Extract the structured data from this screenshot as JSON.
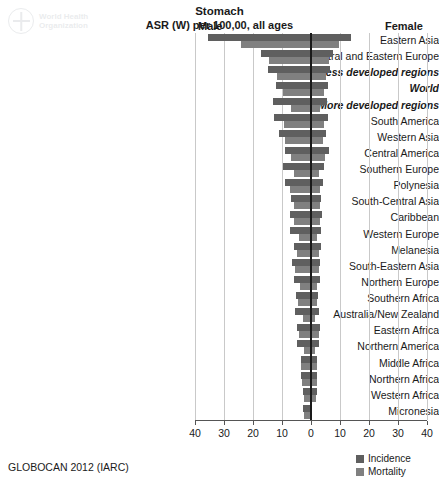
{
  "logo": {
    "line1": "World Health",
    "line2": "Organization",
    "name": "who-logo"
  },
  "header": {
    "title": "Stomach",
    "subtitle": "ASR (W) per 100,00, all ages",
    "male_label": "Male",
    "female_label": "Female"
  },
  "footer": {
    "source": "GLOBOCAN 2012 (IARC)"
  },
  "legend": {
    "items": [
      {
        "label": "Incidence",
        "color": "#5f5f5f"
      },
      {
        "label": "Mortality",
        "color": "#808080"
      }
    ]
  },
  "chart_data": {
    "type": "bar",
    "orientation": "horizontal",
    "layout": "population-pyramid",
    "title": "Stomach",
    "subtitle": "ASR (W) per 100,00, all ages",
    "xlabel": "ASR (W) per 100,00, all ages",
    "ylabel": "",
    "left_side": "Male",
    "right_side": "Female",
    "xlim": [
      -40,
      40
    ],
    "xticks": [
      -40,
      -30,
      -20,
      -10,
      0,
      10,
      20,
      30,
      40
    ],
    "xtick_labels": [
      "40",
      "30",
      "20",
      "10",
      "0",
      "10",
      "20",
      "30",
      "40"
    ],
    "grid": true,
    "legend_position": "bottom-right",
    "series_names": [
      "Incidence",
      "Mortality"
    ],
    "colors": {
      "incidence": "#5f5f5f",
      "mortality": "#808080",
      "zero_line": "#1a1a1a",
      "gridline": "#c9c9c9"
    },
    "categories": [
      "Eastern Asia",
      "Central and Eastern Europe",
      "Less developed regions",
      "World",
      "More developed regions",
      "South America",
      "Western Asia",
      "Central America",
      "Southern Europe",
      "Polynesia",
      "South-Central Asia",
      "Caribbean",
      "Western Europe",
      "Melanesia",
      "South-Eastern Asia",
      "Northern Europe",
      "Southern Africa",
      "Australia/New Zealand",
      "Eastern Africa",
      "Northern America",
      "Middle Africa",
      "Northern Africa",
      "Western Africa",
      "Micronesia"
    ],
    "emphasized_categories": [
      "Less developed regions",
      "World",
      "More developed regions"
    ],
    "rows": [
      {
        "category": "Eastern Asia",
        "male_incidence": 35.4,
        "male_mortality": 24.0,
        "female_incidence": 13.8,
        "female_mortality": 9.8
      },
      {
        "category": "Central and Eastern Europe",
        "male_incidence": 17.1,
        "male_mortality": 14.6,
        "female_incidence": 7.5,
        "female_mortality": 6.2
      },
      {
        "category": "Less developed regions",
        "male_incidence": 15.0,
        "male_mortality": 11.8,
        "female_incidence": 6.5,
        "female_mortality": 5.2
      },
      {
        "category": "World",
        "male_incidence": 12.1,
        "male_mortality": 9.7,
        "female_incidence": 5.7,
        "female_mortality": 4.5
      },
      {
        "category": "More developed regions",
        "male_incidence": 13.0,
        "male_mortality": 7.0,
        "female_incidence": 5.4,
        "female_mortality": 3.1
      },
      {
        "category": "South America",
        "male_incidence": 12.7,
        "male_mortality": 9.3,
        "female_incidence": 5.9,
        "female_mortality": 4.4
      },
      {
        "category": "Western Asia",
        "male_incidence": 11.0,
        "male_mortality": 9.0,
        "female_incidence": 5.0,
        "female_mortality": 4.2
      },
      {
        "category": "Central America",
        "male_incidence": 8.8,
        "male_mortality": 6.8,
        "female_incidence": 6.1,
        "female_mortality": 4.9
      },
      {
        "category": "Southern Europe",
        "male_incidence": 9.6,
        "male_mortality": 5.7,
        "female_incidence": 4.5,
        "female_mortality": 2.7
      },
      {
        "category": "Polynesia",
        "male_incidence": 9.0,
        "male_mortality": 7.1,
        "female_incidence": 4.1,
        "female_mortality": 3.2
      },
      {
        "category": "South-Central Asia",
        "male_incidence": 6.8,
        "male_mortality": 6.0,
        "female_incidence": 3.6,
        "female_mortality": 3.2
      },
      {
        "category": "Caribbean",
        "male_incidence": 7.4,
        "male_mortality": 5.8,
        "female_incidence": 3.9,
        "female_mortality": 3.1
      },
      {
        "category": "Western Europe",
        "male_incidence": 7.4,
        "male_mortality": 4.1,
        "female_incidence": 3.5,
        "female_mortality": 2.0
      },
      {
        "category": "Melanesia",
        "male_incidence": 6.0,
        "male_mortality": 5.0,
        "female_incidence": 3.4,
        "female_mortality": 2.8
      },
      {
        "category": "South-Eastern Asia",
        "male_incidence": 6.4,
        "male_mortality": 5.4,
        "female_incidence": 3.2,
        "female_mortality": 2.7
      },
      {
        "category": "Northern Europe",
        "male_incidence": 6.0,
        "male_mortality": 3.7,
        "female_incidence": 3.0,
        "female_mortality": 1.9
      },
      {
        "category": "Southern Africa",
        "male_incidence": 5.2,
        "male_mortality": 4.4,
        "female_incidence": 2.4,
        "female_mortality": 2.0
      },
      {
        "category": "Australia/New Zealand",
        "male_incidence": 5.4,
        "male_mortality": 2.7,
        "female_incidence": 2.6,
        "female_mortality": 1.4
      },
      {
        "category": "Eastern Africa",
        "male_incidence": 4.7,
        "male_mortality": 4.2,
        "female_incidence": 3.1,
        "female_mortality": 2.8
      },
      {
        "category": "Northern America",
        "male_incidence": 5.0,
        "male_mortality": 2.3,
        "female_incidence": 2.6,
        "female_mortality": 1.3
      },
      {
        "category": "Middle Africa",
        "male_incidence": 3.6,
        "male_mortality": 3.3,
        "female_incidence": 2.2,
        "female_mortality": 2.0
      },
      {
        "category": "Northern Africa",
        "male_incidence": 3.5,
        "male_mortality": 3.1,
        "female_incidence": 2.1,
        "female_mortality": 1.9
      },
      {
        "category": "Western Africa",
        "male_incidence": 2.6,
        "male_mortality": 2.4,
        "female_incidence": 2.0,
        "female_mortality": 1.8
      },
      {
        "category": "Micronesia",
        "male_incidence": 2.6,
        "male_mortality": 2.4,
        "female_incidence": 0.5,
        "female_mortality": 0.4
      }
    ]
  }
}
